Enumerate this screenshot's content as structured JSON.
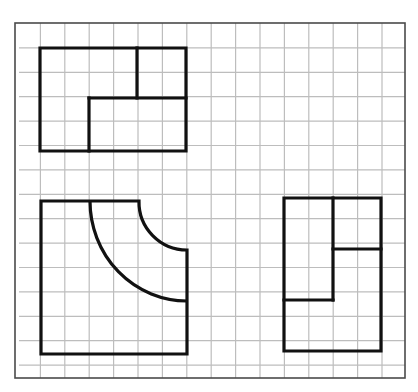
{
  "diagram": {
    "type": "orthographic-views-on-grid",
    "canvas": {
      "width": 418,
      "height": 392,
      "background": "#ffffff"
    },
    "grid": {
      "origin_x": 16,
      "origin_y": 23.5,
      "cell": 24.4,
      "cols": 16,
      "rows": 14.5,
      "line_color": "#bdbdbd"
    },
    "border": {
      "x1": 15,
      "y1": 23,
      "x2": 405,
      "y2": 378,
      "color": "#4a4a4a"
    },
    "views": [
      {
        "name": "top-left-view",
        "description": "Rectangle 6x4 cells with stepped internal division",
        "outline": [
          [
            40,
            48
          ],
          [
            186,
            48
          ],
          [
            186,
            151
          ],
          [
            40,
            151
          ]
        ],
        "inner_lines": [
          [
            [
              137,
              48
            ],
            [
              137,
              98
            ]
          ],
          [
            [
              89,
              98
            ],
            [
              186,
              98
            ]
          ],
          [
            [
              89,
              98
            ],
            [
              89,
              151
            ]
          ]
        ]
      },
      {
        "name": "bottom-left-view",
        "description": "Square 6x6 cells with concave quarter-circle notch at top-right and inner quarter-circle arc",
        "outline_path": "M 41 201 L 139 201 A 48 48 0 0 0 187 250 L 187 354 L 41 354 Z",
        "inner_arc_path": "M 90 201 A 97 100 0 0 0 187 301"
      },
      {
        "name": "right-view",
        "description": "Rectangle 4x6 cells with stepped internal division",
        "outline": [
          [
            284,
            198
          ],
          [
            381,
            198
          ],
          [
            381,
            351
          ],
          [
            284,
            351
          ]
        ],
        "inner_lines": [
          [
            [
              333,
              198
            ],
            [
              333,
              300
            ]
          ],
          [
            [
              333,
              249
            ],
            [
              381,
              249
            ]
          ],
          [
            [
              284,
              300
            ],
            [
              333,
              300
            ]
          ]
        ]
      }
    ]
  }
}
